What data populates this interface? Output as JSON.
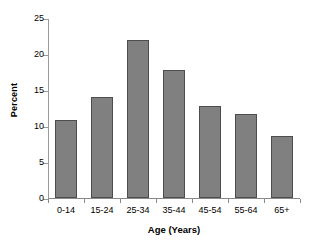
{
  "chart_data": {
    "type": "bar",
    "title": "",
    "xlabel": "Age (Years)",
    "ylabel": "Percent",
    "categories": [
      "0-14",
      "15-24",
      "25-34",
      "35-44",
      "45-54",
      "55-64",
      "65+"
    ],
    "values": [
      10.9,
      14.0,
      21.9,
      17.8,
      12.8,
      11.7,
      8.6
    ],
    "ylim": [
      0,
      25
    ],
    "ytick_labels": [
      "0",
      "5",
      "10",
      "15",
      "20",
      "25"
    ],
    "ytick_values": [
      0,
      5,
      10,
      15,
      20,
      25
    ],
    "ystep": 5,
    "grid": false,
    "legend": false,
    "legend_position": "none",
    "series": [
      {
        "name": "Percent",
        "values": [
          10.9,
          14.0,
          21.9,
          17.8,
          12.8,
          11.7,
          8.6
        ]
      }
    ],
    "colors": {
      "bar_fill": "#808080",
      "bar_border": "#4d4d4d",
      "axis": "#8a8a8a",
      "background": "#ffffff",
      "text": "#000000"
    }
  },
  "axes": {
    "y_title": "Percent",
    "x_title": "Age (Years)"
  }
}
